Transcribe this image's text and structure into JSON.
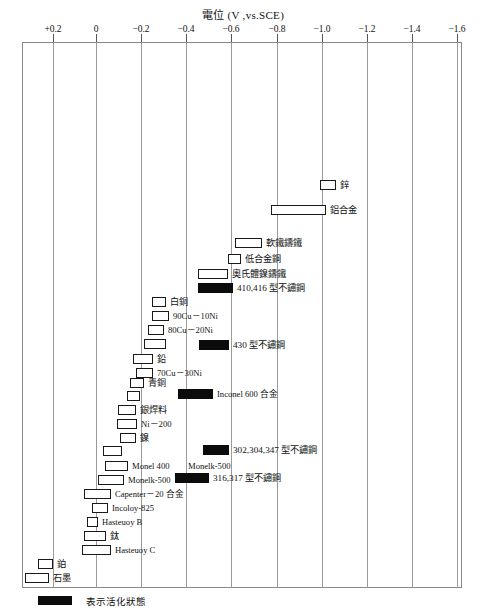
{
  "chart_data": {
    "type": "bar",
    "title": "電位 (V ,vs.SCE)",
    "xlabel": "",
    "ylabel": "",
    "xlim": [
      0.2,
      -1.6
    ],
    "grid": true,
    "legend": {
      "position": "bottom-left",
      "entries": [
        {
          "label": "表示活化狀態",
          "style": "filled-black"
        }
      ]
    },
    "axis_ticks": [
      {
        "label": "+0.2",
        "value": 0.2,
        "x": 53
      },
      {
        "label": "0",
        "value": 0.0,
        "x": 96
      },
      {
        "label": "−0.2",
        "value": -0.2,
        "x": 141
      },
      {
        "label": "−0.4",
        "value": -0.4,
        "x": 186
      },
      {
        "label": "−0.6",
        "value": -0.6,
        "x": 231
      },
      {
        "label": "−0.8",
        "value": -0.8,
        "x": 277
      },
      {
        "label": "−1.0",
        "value": -1.0,
        "x": 322
      },
      {
        "label": "−1.2",
        "value": -1.2,
        "x": 367
      },
      {
        "label": "−1.4",
        "value": -1.4,
        "x": 412
      },
      {
        "label": "−1.6",
        "value": -1.6,
        "x": 457
      }
    ],
    "bars": [
      {
        "label": "鋅",
        "x0": 320,
        "x1": 336,
        "y": 180,
        "active": false,
        "label_side": "right",
        "cjk": true
      },
      {
        "label": "鋁合金",
        "x0": 271,
        "x1": 326,
        "y": 205,
        "active": false,
        "label_side": "right",
        "cjk": true
      },
      {
        "label": "軟鐵鑄鐵",
        "x0": 235,
        "x1": 262,
        "y": 238,
        "active": false,
        "label_side": "right",
        "cjk": true
      },
      {
        "label": "低合金鋼",
        "x0": 228,
        "x1": 241,
        "y": 254,
        "active": false,
        "label_side": "right",
        "cjk": true
      },
      {
        "label": "奧氏體鎳鑄鐵",
        "x0": 198,
        "x1": 228,
        "y": 269,
        "active": false,
        "label_side": "right",
        "cjk": true
      },
      {
        "label": "410,416 型不鏽鋼",
        "x0": 198,
        "x1": 233,
        "y": 283,
        "active": true,
        "label_side": "right",
        "cjk": true
      },
      {
        "label": "白銅",
        "x0": 152,
        "x1": 166,
        "y": 297,
        "active": false,
        "label_side": "right",
        "cjk": true
      },
      {
        "label": "90Cu－10Ni",
        "x0": 152,
        "x1": 169,
        "y": 311,
        "active": false,
        "label_side": "right",
        "cjk": false
      },
      {
        "label": "80Cu－20Ni",
        "x0": 148,
        "x1": 164,
        "y": 325,
        "active": false,
        "label_side": "right",
        "cjk": false
      },
      {
        "label": "",
        "x0": 144,
        "x1": 166,
        "y": 339,
        "active": false,
        "label_side": "right",
        "cjk": false
      },
      {
        "label": "430 型不鏽鋼",
        "x0": 199,
        "x1": 229,
        "y": 340,
        "active": true,
        "label_side": "right",
        "cjk": true
      },
      {
        "label": "鉛",
        "x0": 133,
        "x1": 153,
        "y": 354,
        "active": false,
        "label_side": "right",
        "cjk": true
      },
      {
        "label": "70Cu－30Ni",
        "x0": 136,
        "x1": 153,
        "y": 368,
        "active": false,
        "label_side": "right",
        "cjk": false
      },
      {
        "label": "青銅",
        "x0": 130,
        "x1": 144,
        "y": 378,
        "active": false,
        "label_side": "right",
        "cjk": true
      },
      {
        "label": "",
        "x0": 127,
        "x1": 140,
        "y": 391,
        "active": false,
        "label_side": "right",
        "cjk": false
      },
      {
        "label": "Inconel 600 合金",
        "x0": 178,
        "x1": 213,
        "y": 389,
        "active": true,
        "label_side": "right",
        "cjk": false
      },
      {
        "label": "銀焊料",
        "x0": 118,
        "x1": 136,
        "y": 405,
        "active": false,
        "label_side": "right",
        "cjk": true
      },
      {
        "label": "Ni－200",
        "x0": 117,
        "x1": 137,
        "y": 419,
        "active": false,
        "label_side": "right",
        "cjk": false
      },
      {
        "label": "鎳",
        "x0": 120,
        "x1": 136,
        "y": 433,
        "active": false,
        "label_side": "right",
        "cjk": true
      },
      {
        "label": "",
        "x0": 103,
        "x1": 122,
        "y": 446,
        "active": false,
        "label_side": "right",
        "cjk": false
      },
      {
        "label": "302,304,347 型不鏽鋼",
        "x0": 203,
        "x1": 229,
        "y": 445,
        "active": true,
        "label_side": "right",
        "cjk": true
      },
      {
        "label": "Monel 400",
        "x0": 105,
        "x1": 128,
        "y": 461,
        "active": false,
        "label_side": "right",
        "cjk": false
      },
      {
        "label": "Monelk-500",
        "x0": 98,
        "x1": 124,
        "y": 475,
        "active": false,
        "label_side": "far",
        "cjk": false
      },
      {
        "label": "316,317 型不鏽鋼",
        "x0": 175,
        "x1": 209,
        "y": 473,
        "active": true,
        "label_side": "right",
        "cjk": true
      },
      {
        "label": "Capenter－20 合金",
        "x0": 84,
        "x1": 111,
        "y": 489,
        "active": false,
        "label_side": "right",
        "cjk": false
      },
      {
        "label": "Incoloy-825",
        "x0": 92,
        "x1": 108,
        "y": 503,
        "active": false,
        "label_side": "right",
        "cjk": false
      },
      {
        "label": "Hasteuoy B",
        "x0": 87,
        "x1": 98,
        "y": 517,
        "active": false,
        "label_side": "right",
        "cjk": false
      },
      {
        "label": "鈦",
        "x0": 84,
        "x1": 106,
        "y": 531,
        "active": false,
        "label_side": "right",
        "cjk": true
      },
      {
        "label": "Hasteuoy C",
        "x0": 82,
        "x1": 111,
        "y": 545,
        "active": false,
        "label_side": "right",
        "cjk": false
      },
      {
        "label": "鉑",
        "x0": 38,
        "x1": 53,
        "y": 559,
        "active": false,
        "label_side": "right",
        "cjk": true
      },
      {
        "label": "石墨",
        "x0": 25,
        "x1": 49,
        "y": 573,
        "active": false,
        "label_side": "right",
        "cjk": true
      }
    ],
    "extra_labels": [
      {
        "text": "Monelk-500",
        "x": 188,
        "y": 461
      }
    ]
  }
}
